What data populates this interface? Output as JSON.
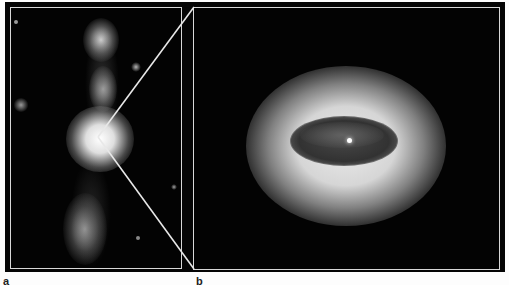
{
  "figure": {
    "panels": [
      {
        "id": "a",
        "label": "a",
        "description": "Wide-field image of a bright core with a bipolar jet extending vertically"
      },
      {
        "id": "b",
        "label": "b",
        "description": "Zoomed view of the core region showing a glowing torus surrounding a dark elliptical disk"
      }
    ],
    "colors": {
      "background": "#050505",
      "frame_border": "#d8d8d8",
      "page": "#fdfdfd"
    }
  }
}
